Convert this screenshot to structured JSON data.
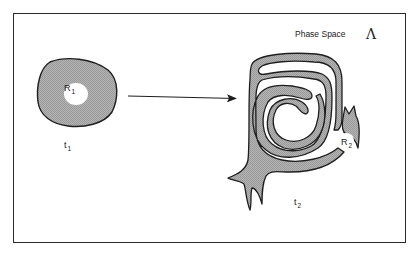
{
  "figure": {
    "title": "Phase Space",
    "symbol": "Λ",
    "initial_region": {
      "label": "R",
      "subscript": "1",
      "time_label": "t",
      "time_subscript": "1"
    },
    "evolved_region": {
      "label": "R",
      "subscript": "2",
      "time_label": "t",
      "time_subscript": "2"
    },
    "arrow": {
      "from": "t1 region",
      "to": "t2 region"
    }
  },
  "colors": {
    "fill": "#a9a9a9",
    "stroke": "#1e1e1e",
    "background": "#ffffff",
    "frame": "#2a2a2a"
  }
}
